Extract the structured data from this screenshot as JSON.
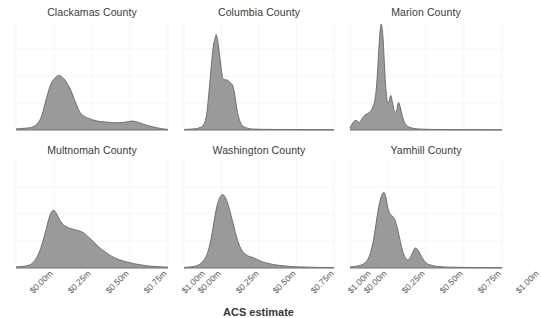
{
  "chart_data": {
    "type": "area",
    "title": "",
    "xlabel": "ACS estimate",
    "ylabel": "",
    "xlim": [
      0,
      1000000
    ],
    "ylim": [
      0,
      1
    ],
    "grid": true,
    "legend": "none",
    "tick_labels": [
      "$0.00m",
      "$0.25m",
      "$0.50m",
      "$0.75m",
      "$1.00m"
    ],
    "tick_values": [
      0,
      250000,
      500000,
      750000,
      1000000
    ],
    "facet_layout": {
      "rows": 2,
      "cols": 3
    },
    "fill_color": "#9a9a9a",
    "line_color": "#6e6e6e",
    "grid_color": "#f0f0f0",
    "panels": [
      {
        "label": "Clackamas County",
        "row": 1,
        "col": 1,
        "peak_x": 280000,
        "peak_y": 0.52,
        "x": [
          0,
          40000,
          80000,
          110000,
          140000,
          170000,
          200000,
          230000,
          260000,
          280000,
          300000,
          330000,
          360000,
          390000,
          420000,
          450000,
          480000,
          520000,
          560000,
          600000,
          640000,
          680000,
          720000,
          760000,
          800000,
          850000,
          900000,
          950000,
          1000000
        ],
        "y": [
          0.01,
          0.015,
          0.02,
          0.03,
          0.06,
          0.14,
          0.3,
          0.44,
          0.5,
          0.52,
          0.51,
          0.46,
          0.38,
          0.27,
          0.17,
          0.13,
          0.11,
          0.09,
          0.08,
          0.075,
          0.07,
          0.07,
          0.075,
          0.085,
          0.075,
          0.05,
          0.03,
          0.015,
          0.005
        ]
      },
      {
        "label": "Columbia County",
        "row": 1,
        "col": 2,
        "peak_x": 215000,
        "peak_y": 0.9,
        "x": [
          0,
          60000,
          100000,
          130000,
          150000,
          165000,
          180000,
          195000,
          210000,
          218000,
          230000,
          245000,
          258000,
          268000,
          280000,
          295000,
          310000,
          325000,
          338000,
          350000,
          365000,
          385000,
          410000,
          440000,
          480000,
          540000,
          620000,
          750000,
          1000000
        ],
        "y": [
          0.005,
          0.01,
          0.02,
          0.05,
          0.14,
          0.34,
          0.58,
          0.79,
          0.89,
          0.9,
          0.8,
          0.62,
          0.5,
          0.48,
          0.48,
          0.47,
          0.45,
          0.42,
          0.34,
          0.22,
          0.12,
          0.05,
          0.025,
          0.012,
          0.008,
          0.006,
          0.005,
          0.004,
          0.003
        ]
      },
      {
        "label": "Marion County",
        "row": 1,
        "col": 3,
        "peak_x": 205000,
        "peak_y": 1.0,
        "x": [
          0,
          25000,
          45000,
          60000,
          75000,
          90000,
          105000,
          120000,
          135000,
          150000,
          165000,
          178000,
          190000,
          200000,
          208000,
          218000,
          228000,
          238000,
          248000,
          258000,
          268000,
          278000,
          288000,
          298000,
          308000,
          318000,
          330000,
          345000,
          360000,
          380000,
          410000,
          450000,
          520000,
          640000,
          800000,
          1000000
        ],
        "y": [
          0.02,
          0.08,
          0.09,
          0.07,
          0.1,
          0.13,
          0.15,
          0.16,
          0.18,
          0.22,
          0.3,
          0.48,
          0.78,
          0.97,
          1.0,
          0.86,
          0.58,
          0.36,
          0.26,
          0.28,
          0.33,
          0.27,
          0.2,
          0.17,
          0.19,
          0.26,
          0.22,
          0.13,
          0.07,
          0.035,
          0.018,
          0.01,
          0.006,
          0.004,
          0.003,
          0.002
        ]
      },
      {
        "label": "Multnomah County",
        "row": 2,
        "col": 1,
        "peak_x": 250000,
        "peak_y": 0.55,
        "x": [
          0,
          40000,
          80000,
          110000,
          140000,
          170000,
          200000,
          225000,
          245000,
          262000,
          280000,
          300000,
          325000,
          350000,
          375000,
          400000,
          425000,
          450000,
          480000,
          510000,
          545000,
          580000,
          620000,
          660000,
          700000,
          750000,
          800000,
          870000,
          940000,
          1000000
        ],
        "y": [
          0.01,
          0.015,
          0.025,
          0.05,
          0.11,
          0.22,
          0.38,
          0.51,
          0.55,
          0.53,
          0.48,
          0.43,
          0.4,
          0.38,
          0.37,
          0.36,
          0.35,
          0.33,
          0.29,
          0.25,
          0.2,
          0.16,
          0.12,
          0.09,
          0.07,
          0.05,
          0.035,
          0.02,
          0.012,
          0.008
        ]
      },
      {
        "label": "Washington County",
        "row": 2,
        "col": 2,
        "peak_x": 270000,
        "peak_y": 0.7,
        "x": [
          0,
          50000,
          90000,
          120000,
          150000,
          175000,
          198000,
          218000,
          238000,
          255000,
          268000,
          280000,
          295000,
          312000,
          330000,
          348000,
          368000,
          390000,
          412000,
          435000,
          460000,
          490000,
          520000,
          560000,
          610000,
          670000,
          740000,
          830000,
          920000,
          1000000
        ],
        "y": [
          0.005,
          0.012,
          0.025,
          0.055,
          0.12,
          0.24,
          0.42,
          0.58,
          0.67,
          0.7,
          0.69,
          0.66,
          0.6,
          0.51,
          0.41,
          0.31,
          0.22,
          0.16,
          0.13,
          0.11,
          0.1,
          0.08,
          0.06,
          0.045,
          0.03,
          0.02,
          0.012,
          0.008,
          0.005,
          0.004
        ]
      },
      {
        "label": "Yamhill County",
        "row": 2,
        "col": 3,
        "peak_x": 230000,
        "peak_y": 0.72,
        "x": [
          0,
          50000,
          90000,
          120000,
          145000,
          165000,
          185000,
          205000,
          222000,
          235000,
          248000,
          262000,
          275000,
          288000,
          300000,
          315000,
          330000,
          345000,
          360000,
          375000,
          392000,
          410000,
          428000,
          448000,
          470000,
          500000,
          540000,
          600000,
          700000,
          850000,
          1000000
        ],
        "y": [
          0.01,
          0.02,
          0.04,
          0.09,
          0.2,
          0.36,
          0.55,
          0.68,
          0.72,
          0.68,
          0.58,
          0.52,
          0.5,
          0.48,
          0.44,
          0.36,
          0.26,
          0.17,
          0.11,
          0.08,
          0.09,
          0.14,
          0.19,
          0.17,
          0.11,
          0.05,
          0.025,
          0.012,
          0.007,
          0.004,
          0.003
        ]
      }
    ]
  }
}
